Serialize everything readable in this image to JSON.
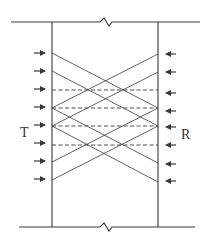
{
  "diagram": {
    "labels": {
      "left": "T",
      "right": "R"
    },
    "colors": {
      "line": "#3a3a3a",
      "background": "#ffffff"
    },
    "walls": {
      "left_x": 52,
      "right_x": 158,
      "top_y": 22,
      "bottom_y": 227
    },
    "boundaries": {
      "top": {
        "y": 22,
        "x_start": 11,
        "x_end": 200,
        "break_x": 106
      },
      "bottom": {
        "y": 227,
        "x_start": 19,
        "x_end": 195,
        "break_x": 106
      }
    },
    "left_arrows_y": [
      53,
      71,
      89,
      107,
      125,
      143,
      161,
      179
    ],
    "right_arrows_y": [
      54,
      72,
      93,
      111,
      127,
      145,
      164,
      181
    ],
    "solid_rays": [
      {
        "from": [
          52,
          53
        ],
        "to": [
          158,
          108
        ]
      },
      {
        "from": [
          52,
          71
        ],
        "to": [
          158,
          126
        ]
      },
      {
        "from": [
          52,
          108
        ],
        "to": [
          158,
          163
        ]
      },
      {
        "from": [
          52,
          126
        ],
        "to": [
          158,
          182
        ]
      },
      {
        "from": [
          158,
          54
        ],
        "to": [
          52,
          108
        ]
      },
      {
        "from": [
          158,
          72
        ],
        "to": [
          52,
          126
        ]
      },
      {
        "from": [
          158,
          108
        ],
        "to": [
          52,
          162
        ]
      },
      {
        "from": [
          158,
          126
        ],
        "to": [
          52,
          180
        ]
      }
    ],
    "dashed_lines_y": [
      90,
      108,
      126,
      145
    ]
  }
}
